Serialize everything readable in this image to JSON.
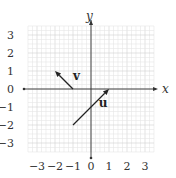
{
  "diagram": {
    "type": "coordinate-plane-vectors",
    "axes": {
      "x_label": "x",
      "y_label": "y",
      "x_range": [
        -3.5,
        3.5
      ],
      "y_range": [
        -3.5,
        3.5
      ],
      "x_ticks": [
        "−3",
        "−2",
        "−1",
        "0",
        "1",
        "2",
        "3"
      ],
      "y_ticks": [
        "3",
        "2",
        "1",
        "0",
        "−1",
        "−2",
        "−3"
      ],
      "minor_grid_step": 0.25,
      "grid": true
    },
    "vectors": [
      {
        "name": "v",
        "label": "v",
        "from": [
          -1,
          0
        ],
        "to": [
          -2,
          1
        ]
      },
      {
        "name": "u",
        "label": "u",
        "from": [
          -1,
          -2
        ],
        "to": [
          1,
          0
        ]
      }
    ],
    "colors": {
      "grid_minor": "#e6e6e6",
      "grid_major": "#d0d0d0",
      "axis": "#333333",
      "vector": "#222222"
    }
  }
}
